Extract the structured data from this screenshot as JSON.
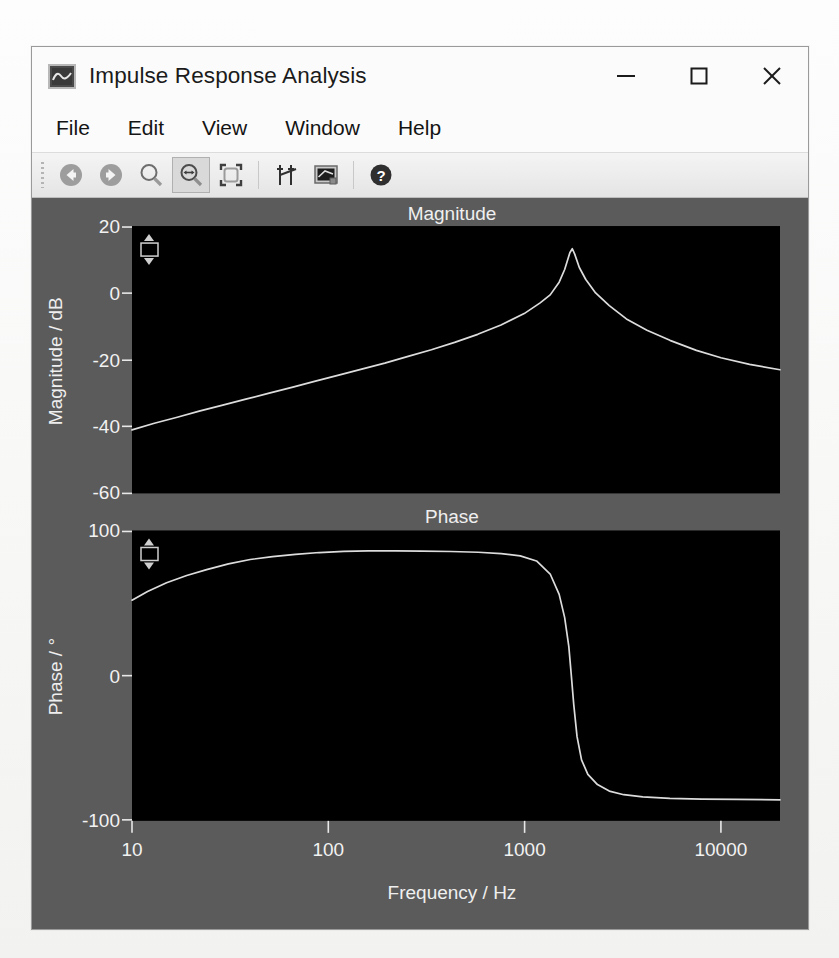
{
  "window": {
    "title": "Impulse Response Analysis",
    "icon": "waveform-app-icon",
    "controls": {
      "minimize": "minimize-icon",
      "maximize": "maximize-icon",
      "close": "close-icon"
    }
  },
  "menubar": {
    "items": [
      {
        "label": "File"
      },
      {
        "label": "Edit"
      },
      {
        "label": "View"
      },
      {
        "label": "Window"
      },
      {
        "label": "Help"
      }
    ]
  },
  "toolbar": {
    "buttons": [
      {
        "name": "back-icon",
        "tooltip": "Back",
        "active": false
      },
      {
        "name": "forward-icon",
        "tooltip": "Forward",
        "active": false
      },
      {
        "name": "zoom-icon",
        "tooltip": "Zoom",
        "active": false
      },
      {
        "name": "zoom-x-icon",
        "tooltip": "Zoom Horizontal",
        "active": true
      },
      {
        "name": "fit-window-icon",
        "tooltip": "Fit to Window",
        "active": false
      },
      {
        "name": "cursors-icon",
        "tooltip": "Cursors",
        "active": false
      },
      {
        "name": "display-icon",
        "tooltip": "Display",
        "active": false
      },
      {
        "name": "help-icon",
        "tooltip": "Help",
        "active": false
      }
    ]
  },
  "colors": {
    "plot_background": "#000000",
    "panel_background": "#5b5b5b",
    "trace": "#dcdcdc",
    "window_chrome": "#fbfbfb",
    "toolbar_active": "#d9d9d9"
  },
  "widgets": {
    "magnitude_scale_spinner": "scale-spinner",
    "phase_scale_spinner": "scale-spinner"
  },
  "chart_data": [
    {
      "type": "line",
      "title": "Magnitude",
      "xlabel": "Frequency / Hz",
      "ylabel": "Magnitude / dB",
      "xscale": "log",
      "xlim": [
        10,
        20000
      ],
      "ylim": [
        -60,
        20
      ],
      "xticks": [
        10,
        100,
        1000,
        10000
      ],
      "xticklabels": [
        "10",
        "100",
        "1000",
        "10000"
      ],
      "yticks": [
        20,
        0,
        -20,
        -40,
        -60
      ],
      "yticklabels": [
        "20",
        "0",
        "-20",
        "-40",
        "-60"
      ],
      "grid": false,
      "legend": "none",
      "x": [
        10,
        13,
        17,
        22,
        29,
        38,
        50,
        66,
        86,
        113,
        148,
        194,
        255,
        335,
        440,
        577,
        758,
        995,
        1200,
        1350,
        1500,
        1600,
        1700,
        1750,
        1800,
        1900,
        2050,
        2300,
        2700,
        3300,
        4200,
        5500,
        7500,
        10000,
        14000,
        20000
      ],
      "y": [
        -41.0,
        -39.0,
        -37.2,
        -35.4,
        -33.6,
        -31.8,
        -30.0,
        -28.2,
        -26.4,
        -24.6,
        -22.8,
        -21.0,
        -19.0,
        -17.0,
        -14.8,
        -12.4,
        -9.6,
        -6.2,
        -3.0,
        -0.6,
        3.2,
        7.0,
        12.0,
        13.2,
        11.6,
        7.6,
        4.0,
        0.0,
        -3.8,
        -7.8,
        -11.2,
        -14.2,
        -17.2,
        -19.4,
        -21.4,
        -23.0
      ]
    },
    {
      "type": "line",
      "title": "Phase",
      "xlabel": "Frequency / Hz",
      "ylabel": "Phase / °",
      "xscale": "log",
      "xlim": [
        10,
        20000
      ],
      "ylim": [
        -100,
        100
      ],
      "xticks": [
        10,
        100,
        1000,
        10000
      ],
      "xticklabels": [
        "10",
        "100",
        "1000",
        "10000"
      ],
      "yticks": [
        100,
        0,
        -100
      ],
      "yticklabels": [
        "100",
        "0",
        "-100"
      ],
      "grid": false,
      "legend": "none",
      "x": [
        10,
        12,
        15,
        19,
        24,
        31,
        40,
        52,
        68,
        90,
        120,
        160,
        220,
        300,
        420,
        580,
        760,
        950,
        1150,
        1350,
        1500,
        1600,
        1680,
        1730,
        1780,
        1850,
        1950,
        2100,
        2350,
        2700,
        3200,
        4000,
        5500,
        8000,
        12000,
        20000
      ],
      "y": [
        52.0,
        58.0,
        64.0,
        69.0,
        73.0,
        77.0,
        80.0,
        82.0,
        83.5,
        84.8,
        85.6,
        86.0,
        86.0,
        85.8,
        85.5,
        85.0,
        84.0,
        82.5,
        79.0,
        70.0,
        56.0,
        40.0,
        20.0,
        0.0,
        -20.0,
        -42.0,
        -58.0,
        -68.0,
        -75.0,
        -79.5,
        -82.0,
        -83.5,
        -84.5,
        -85.0,
        -85.2,
        -85.5
      ]
    }
  ]
}
